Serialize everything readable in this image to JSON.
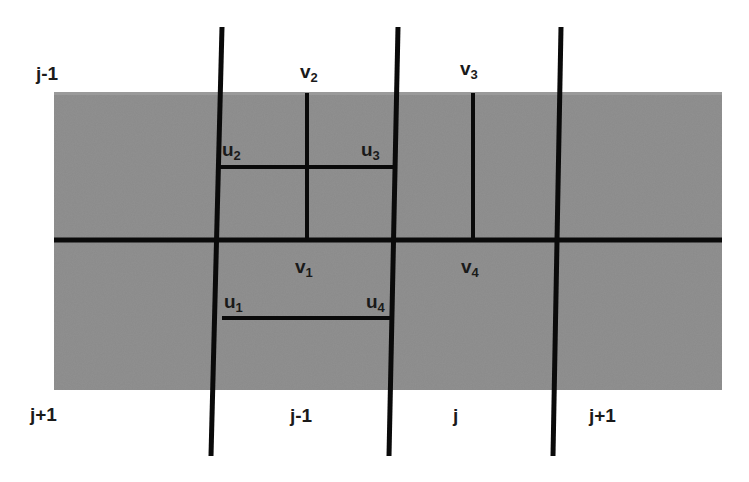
{
  "diagram": {
    "type": "staggered-grid",
    "colors": {
      "background": "#ffffff",
      "region_fill": "#8a8a8a",
      "line": "#0a0a0a",
      "text": "#1a1a1a"
    },
    "row_labels": {
      "top": "j-1",
      "bottom": "j+1"
    },
    "column_labels": [
      {
        "id": "col-j-minus-1",
        "text": "j-1"
      },
      {
        "id": "col-j",
        "text": "j"
      },
      {
        "id": "col-j-plus-1",
        "text": "j+1"
      }
    ],
    "nodes": {
      "v2": {
        "base": "v",
        "sub": "2"
      },
      "v3": {
        "base": "v",
        "sub": "3"
      },
      "u2": {
        "base": "u",
        "sub": "2"
      },
      "u3": {
        "base": "u",
        "sub": "3"
      },
      "v1": {
        "base": "v",
        "sub": "1"
      },
      "v4": {
        "base": "v",
        "sub": "4"
      },
      "u1": {
        "base": "u",
        "sub": "1"
      },
      "u4": {
        "base": "u",
        "sub": "4"
      }
    }
  }
}
